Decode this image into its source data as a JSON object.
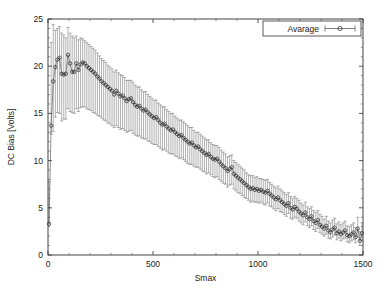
{
  "chart_data": {
    "type": "scatter",
    "title": "",
    "xlabel": "Smax",
    "ylabel": "DC Bias [Volts]",
    "xlim": [
      0,
      1500
    ],
    "ylim": [
      0,
      25
    ],
    "xticks": [
      0,
      500,
      1000,
      1500
    ],
    "yticks": [
      0,
      5,
      10,
      15,
      20,
      25
    ],
    "xtick_labels": [
      "0",
      "500",
      "1000",
      "1500"
    ],
    "ytick_labels": [
      "0",
      "5",
      "10",
      "15",
      "20",
      "25"
    ],
    "grid": false,
    "legend": {
      "position": "top-right-inside",
      "entries": [
        {
          "name": "Avarage",
          "marker": "open-circle",
          "line": "solid",
          "color": "#4a4a4a"
        }
      ]
    },
    "marker_style": "open-circle",
    "has_error_bars": true,
    "error_bar_orientation": "vertical",
    "series": [
      {
        "name": "Avarage",
        "x": [
          5,
          15,
          25,
          35,
          45,
          55,
          65,
          75,
          85,
          95,
          105,
          115,
          125,
          135,
          145,
          155,
          165,
          175,
          185,
          195,
          205,
          215,
          225,
          235,
          245,
          255,
          265,
          275,
          285,
          295,
          305,
          315,
          325,
          335,
          345,
          355,
          365,
          375,
          385,
          395,
          405,
          415,
          425,
          435,
          445,
          455,
          465,
          475,
          485,
          495,
          505,
          515,
          525,
          535,
          545,
          555,
          565,
          575,
          585,
          595,
          605,
          615,
          625,
          635,
          645,
          655,
          665,
          675,
          685,
          695,
          705,
          715,
          725,
          735,
          745,
          755,
          765,
          775,
          785,
          795,
          805,
          815,
          825,
          835,
          845,
          855,
          865,
          875,
          885,
          895,
          905,
          915,
          925,
          935,
          945,
          955,
          965,
          975,
          985,
          995,
          1005,
          1015,
          1025,
          1035,
          1045,
          1055,
          1065,
          1075,
          1085,
          1095,
          1105,
          1115,
          1125,
          1135,
          1145,
          1155,
          1165,
          1175,
          1185,
          1195,
          1205,
          1215,
          1225,
          1235,
          1245,
          1255,
          1265,
          1275,
          1285,
          1295,
          1305,
          1315,
          1325,
          1335,
          1345,
          1355,
          1365,
          1375,
          1385,
          1395,
          1405,
          1415,
          1425,
          1435,
          1445,
          1455,
          1465,
          1475,
          1485,
          1495
        ],
        "y": [
          3.3,
          13.7,
          18.4,
          19.9,
          20.7,
          20.9,
          19.2,
          19.1,
          19.2,
          21.2,
          20.3,
          19.4,
          19.4,
          20.3,
          19.6,
          20.2,
          20.4,
          20.3,
          20.0,
          19.8,
          19.6,
          19.4,
          19.2,
          18.9,
          18.7,
          18.4,
          18.2,
          18.0,
          17.8,
          17.6,
          17.4,
          17.0,
          17.4,
          17.1,
          16.8,
          16.9,
          16.6,
          16.3,
          16.5,
          16.6,
          16.2,
          15.9,
          15.7,
          15.8,
          15.5,
          15.3,
          15.4,
          15.1,
          14.9,
          14.7,
          14.5,
          14.6,
          14.3,
          14.0,
          13.8,
          13.9,
          13.6,
          13.4,
          13.2,
          13.3,
          13.0,
          12.8,
          12.6,
          12.7,
          12.4,
          12.2,
          12.0,
          11.8,
          11.9,
          11.6,
          11.4,
          11.5,
          11.2,
          11.0,
          10.8,
          10.6,
          10.7,
          10.4,
          10.2,
          10.1,
          10.2,
          9.9,
          9.6,
          9.4,
          9.2,
          8.9,
          9.1,
          9.3,
          8.6,
          8.4,
          8.2,
          8.0,
          7.8,
          7.6,
          7.4,
          7.2,
          7.0,
          7.1,
          6.9,
          7.0,
          6.8,
          6.9,
          6.7,
          6.6,
          6.8,
          6.5,
          6.3,
          6.1,
          5.9,
          6.1,
          5.8,
          5.6,
          5.4,
          5.2,
          5.5,
          5.0,
          4.8,
          5.1,
          4.9,
          4.6,
          4.4,
          4.2,
          4.5,
          4.0,
          3.8,
          4.1,
          3.6,
          3.4,
          3.7,
          3.2,
          3.0,
          2.8,
          3.1,
          2.6,
          2.4,
          2.7,
          2.9,
          2.3,
          2.5,
          2.2,
          2.4,
          2.6,
          2.1,
          2.0,
          2.2,
          2.4,
          1.9,
          2.8,
          1.5,
          2.3
        ],
        "yerr_low": [
          0.0,
          0.9,
          5.3,
          5.3,
          5.6,
          5.9,
          5.0,
          4.7,
          4.8,
          5.7,
          5.1,
          4.3,
          4.4,
          4.8,
          4.4,
          4.6,
          4.7,
          4.6,
          4.5,
          4.4,
          4.3,
          4.3,
          4.2,
          4.1,
          4.0,
          3.9,
          3.9,
          3.8,
          3.8,
          3.7,
          3.7,
          3.5,
          3.7,
          3.6,
          3.5,
          3.5,
          3.4,
          3.3,
          3.4,
          3.4,
          3.3,
          3.2,
          3.1,
          3.2,
          3.1,
          3.0,
          3.1,
          3.0,
          2.9,
          2.9,
          2.8,
          2.9,
          2.8,
          2.7,
          2.7,
          2.7,
          2.6,
          2.6,
          2.5,
          2.6,
          2.5,
          2.4,
          2.4,
          2.4,
          2.3,
          2.3,
          2.3,
          2.2,
          2.3,
          2.2,
          2.1,
          2.2,
          2.1,
          2.1,
          2.0,
          2.0,
          2.0,
          1.9,
          1.9,
          1.9,
          1.9,
          1.9,
          1.8,
          1.8,
          1.7,
          1.7,
          1.7,
          1.8,
          1.6,
          1.6,
          1.6,
          1.5,
          1.5,
          1.5,
          1.4,
          1.4,
          1.4,
          1.4,
          1.3,
          1.4,
          1.3,
          1.3,
          1.3,
          1.3,
          1.3,
          1.3,
          1.2,
          1.2,
          1.2,
          1.2,
          1.2,
          1.1,
          1.1,
          1.1,
          1.1,
          1.1,
          1.0,
          1.1,
          1.0,
          1.0,
          1.0,
          1.0,
          1.0,
          0.9,
          0.9,
          1.0,
          0.9,
          0.9,
          0.9,
          0.8,
          0.8,
          0.8,
          0.9,
          0.8,
          0.7,
          0.8,
          0.8,
          0.7,
          0.7,
          0.7,
          0.7,
          0.8,
          0.7,
          0.7,
          0.7,
          0.8,
          0.6,
          0.9,
          0.5,
          0.8
        ],
        "yerr_high": [
          4.5,
          8.8,
          6.0,
          3.9,
          3.3,
          3.3,
          4.3,
          4.2,
          3.8,
          2.9,
          3.2,
          3.8,
          3.6,
          2.9,
          3.2,
          2.8,
          2.5,
          2.4,
          2.5,
          2.5,
          2.5,
          2.5,
          2.5,
          2.5,
          2.4,
          2.4,
          2.4,
          2.4,
          2.3,
          2.3,
          2.3,
          2.4,
          2.2,
          2.2,
          2.3,
          2.1,
          2.2,
          2.2,
          2.0,
          1.9,
          2.1,
          2.1,
          2.1,
          2.0,
          2.0,
          2.0,
          1.9,
          1.9,
          1.9,
          1.9,
          1.9,
          1.8,
          1.8,
          1.9,
          1.9,
          1.8,
          1.8,
          1.8,
          1.8,
          1.7,
          1.7,
          1.7,
          1.7,
          1.6,
          1.7,
          1.7,
          1.7,
          1.7,
          1.6,
          1.6,
          1.6,
          1.5,
          1.6,
          1.6,
          1.6,
          1.6,
          1.5,
          1.5,
          1.5,
          1.5,
          1.4,
          1.5,
          1.5,
          1.5,
          1.5,
          1.5,
          1.4,
          1.3,
          1.4,
          1.4,
          1.4,
          1.4,
          1.4,
          1.4,
          1.3,
          1.3,
          1.4,
          1.3,
          1.3,
          1.3,
          1.3,
          1.2,
          1.3,
          1.3,
          1.2,
          1.2,
          1.2,
          1.2,
          1.2,
          1.2,
          1.2,
          1.2,
          1.2,
          1.2,
          1.1,
          1.2,
          1.2,
          1.1,
          1.1,
          1.2,
          1.1,
          1.1,
          1.1,
          1.1,
          1.1,
          1.0,
          1.1,
          1.1,
          1.0,
          1.1,
          1.1,
          1.0,
          1.0,
          1.0,
          1.0,
          1.0,
          1.0,
          1.0,
          1.0,
          1.0,
          1.0,
          1.0,
          1.0,
          1.0,
          1.0,
          1.0,
          1.0,
          1.2,
          1.0,
          1.1
        ]
      }
    ]
  },
  "axes": {
    "x_title": "Smax",
    "y_title": "DC Bias [Volts]"
  },
  "legend_label": "Avarage"
}
